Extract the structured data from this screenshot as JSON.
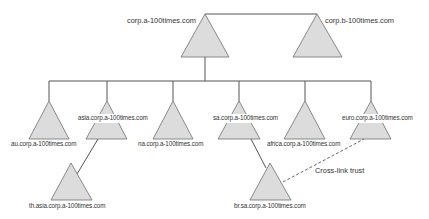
{
  "diagram": {
    "type": "active-directory-forest",
    "colors": {
      "triangle_fill": "#dcdcdc",
      "triangle_stroke": "#6e6e6e",
      "line": "#555555",
      "text": "#333333"
    },
    "trees": [
      {
        "root": "corp.a-100times.com",
        "children": [
          {
            "domain": "au.corp.a-100times.com",
            "children": []
          },
          {
            "domain": "asia.corp.a-100times.com",
            "children": [
              {
                "domain": "th.asia.corp.a-100times.com"
              }
            ]
          },
          {
            "domain": "na.corp.a-100times.com",
            "children": []
          },
          {
            "domain": "sa.corp.a-100times.com",
            "children": [
              {
                "domain": "br.sa.corp.a-100times.com"
              }
            ]
          },
          {
            "domain": "africa.corp.a-100times.com",
            "children": []
          },
          {
            "domain": "euro.corp.a-100times.com",
            "children": []
          }
        ]
      },
      {
        "root": "corp.b-100times.com",
        "children": []
      }
    ],
    "trusts": [
      {
        "type": "cross-link",
        "from": "euro.corp.a-100times.com",
        "to": "br.sa.corp.a-100times.com",
        "label": "Cross-link trust",
        "style": "dashed"
      }
    ]
  },
  "labels": {
    "corp_a": "corp.a-100times.com",
    "corp_b": "corp.b-100times.com",
    "au": "au.corp.a-100times.com",
    "asia": "asia.corp.a-100times.com",
    "na": "na.corp.a-100times.com",
    "sa": "sa.corp.a-100times.com",
    "africa": "africa.corp.a-100times.com",
    "euro": "euro.corp.a-100times.com",
    "th": "th.asia.corp.a-100times.com",
    "br": "br.sa.corp.a-100times.com",
    "cross_link": "Cross-link trust"
  }
}
